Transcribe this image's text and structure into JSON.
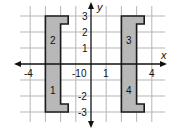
{
  "diagram": {
    "type": "coordinate-plane",
    "axes": {
      "x_label": "x",
      "y_label": "y",
      "x_range": [
        -4.5,
        4.5
      ],
      "y_range": [
        -3.5,
        3.5
      ],
      "x_ticks": [
        {
          "value": -4,
          "label": "-4"
        },
        {
          "value": -1,
          "label": "-1"
        },
        {
          "value": 1,
          "label": "1"
        },
        {
          "value": 4,
          "label": "4"
        }
      ],
      "y_ticks": [
        {
          "value": 3,
          "label": "3"
        },
        {
          "value": 2,
          "label": "2"
        },
        {
          "value": 1,
          "label": "1"
        },
        {
          "value": -2,
          "label": "-2"
        },
        {
          "value": -3,
          "label": "-3"
        }
      ],
      "origin_label": "0"
    },
    "grid": {
      "spacing": 1,
      "color": "#b0b0b0"
    },
    "shapes": [
      {
        "name": "left-bracket-shape",
        "fill": "#b8b8b8",
        "stroke": "#1a1a1a",
        "vertices": [
          [
            -3,
            3
          ],
          [
            -1.5,
            3
          ],
          [
            -1.5,
            2.5
          ],
          [
            -2,
            2.5
          ],
          [
            -2,
            -2.5
          ],
          [
            -1.5,
            -2.5
          ],
          [
            -1.5,
            -3
          ],
          [
            -3,
            -3
          ]
        ],
        "regions": [
          {
            "label": "2",
            "center": [
              -2.5,
              1.5
            ]
          },
          {
            "label": "1",
            "center": [
              -2.5,
              -1.5
            ]
          }
        ]
      },
      {
        "name": "right-bracket-shape",
        "fill": "#b8b8b8",
        "stroke": "#1a1a1a",
        "vertices": [
          [
            2,
            3
          ],
          [
            3.5,
            3
          ],
          [
            3.5,
            2.5
          ],
          [
            3,
            2.5
          ],
          [
            3,
            -2.5
          ],
          [
            3.5,
            -2.5
          ],
          [
            3.5,
            -3
          ],
          [
            2,
            -3
          ]
        ],
        "regions": [
          {
            "label": "3",
            "center": [
              2.5,
              1.5
            ]
          },
          {
            "label": "4",
            "center": [
              2.5,
              -1.5
            ]
          }
        ]
      }
    ]
  },
  "labels": {
    "x_axis": "x",
    "y_axis": "y",
    "tick_x_neg4": "-4",
    "tick_x_neg1": "-1",
    "origin": "0",
    "tick_x_1": "1",
    "tick_x_4": "4",
    "tick_y_3": "3",
    "tick_y_2": "2",
    "tick_y_1": "1",
    "tick_y_neg2": "-2",
    "tick_y_neg3": "-3",
    "region_1": "1",
    "region_2": "2",
    "region_3": "3",
    "region_4": "4"
  }
}
